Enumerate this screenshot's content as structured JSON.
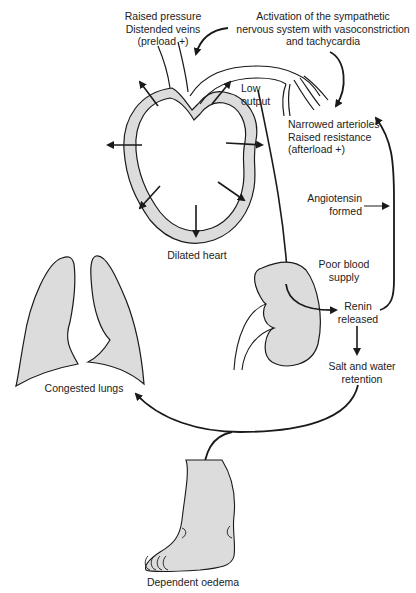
{
  "diagram": {
    "colors": {
      "line": "#1a1a1a",
      "fill": "#dcdcdc",
      "text": "#222222",
      "background": "#ffffff"
    },
    "labels": {
      "raised_pressure": "Raised pressure\nDistended veins\n(preload +)",
      "sympathetic": "Activation of the sympathetic\nnervous system with vasoconstriction\nand tachycardia",
      "low_output": "Low\noutput",
      "narrowed_arterioles": "Narrowed arterioles\nRaised resistance\n(afterload +)",
      "angiotensin": "Angiotensin\nformed",
      "dilated_heart": "Dilated heart",
      "poor_blood_supply": "Poor blood\nsupply",
      "renin_released": "Renin\nreleased",
      "salt_water": "Salt and water\nretention",
      "congested_lungs": "Congested lungs",
      "dependent_oedema": "Dependent oedema"
    },
    "nodes": [
      {
        "id": "heart",
        "icon": "dilated-heart-icon"
      },
      {
        "id": "lungs",
        "icon": "lungs-icon"
      },
      {
        "id": "kidney",
        "icon": "kidney-icon"
      },
      {
        "id": "foot",
        "icon": "swollen-foot-icon"
      }
    ]
  }
}
